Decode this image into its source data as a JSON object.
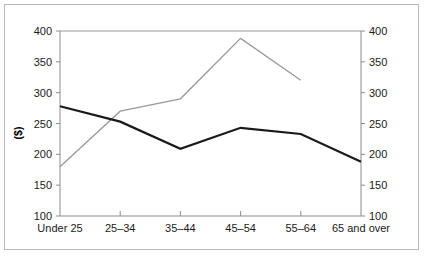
{
  "chart_data": {
    "type": "line",
    "title": "",
    "xlabel": "",
    "ylabel": "($)",
    "y2label": "",
    "categories": [
      "Under 25",
      "25–34",
      "35–44",
      "45–54",
      "55–64",
      "65 and over"
    ],
    "ylim": [
      100,
      400
    ],
    "y2lim": [
      100,
      400
    ],
    "yticks": [
      100,
      150,
      200,
      250,
      300,
      350,
      400
    ],
    "y2ticks": [
      100,
      150,
      200,
      250,
      300,
      350,
      400
    ],
    "ytick_labels": [
      "100",
      "150",
      "200",
      "250",
      "300",
      "350",
      "400"
    ],
    "y2tick_labels": [
      "100",
      "150",
      "200",
      "250",
      "300",
      "350",
      "400"
    ],
    "grid": false,
    "legend": "none",
    "series": [
      {
        "name": "series-black",
        "color": "#1a1a1a",
        "width": 2.2,
        "values": [
          278,
          253,
          209,
          243,
          233,
          188
        ]
      },
      {
        "name": "series-gray",
        "color": "#9a9a9a",
        "width": 1.3,
        "values": [
          180,
          270,
          290,
          388,
          320,
          null
        ]
      }
    ]
  },
  "axes": {
    "left_title": "($)"
  },
  "frame": {
    "border_color": "#b9b9b9",
    "background": "#ffffff"
  }
}
